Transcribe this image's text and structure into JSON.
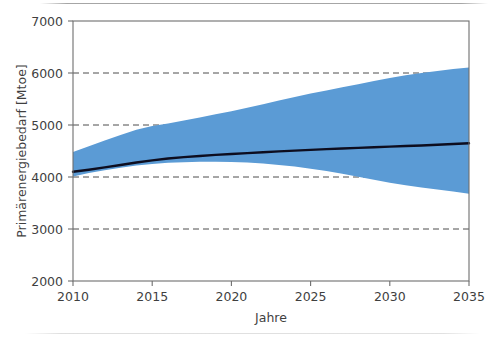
{
  "chart_data": {
    "type": "area",
    "title": "",
    "subtitle": "",
    "xlabel": "Jahre",
    "ylabel": "Primärenergiebedarf [Mtoe]",
    "xlim": [
      2010,
      2035
    ],
    "ylim": [
      2000,
      7000
    ],
    "x_ticks": [
      2010,
      2015,
      2020,
      2025,
      2030,
      2035
    ],
    "x_tick_labels": [
      "2010",
      "2015",
      "2020",
      "2025",
      "2030",
      "2035"
    ],
    "y_ticks": [
      2000,
      3000,
      4000,
      5000,
      6000,
      7000
    ],
    "y_tick_labels": [
      "2000",
      "3000",
      "4000",
      "5000",
      "6000",
      "7000"
    ],
    "grid": "horizontal-dashed",
    "gridlines_at": [
      3000,
      4000,
      5000,
      6000
    ],
    "legend": "none",
    "legend_position": "none",
    "colors": {
      "band": "#5B9BD5",
      "line": "#0d0d1f",
      "grid": "#4d4d4d",
      "frame": "#6e6e6e",
      "text": "#3f3f3f",
      "background": "#ffffff"
    },
    "x": [
      2010,
      2011,
      2012,
      2013,
      2014,
      2015,
      2016,
      2017,
      2018,
      2019,
      2020,
      2021,
      2022,
      2023,
      2024,
      2025,
      2026,
      2027,
      2028,
      2029,
      2030,
      2031,
      2032,
      2033,
      2034,
      2035
    ],
    "series": [
      {
        "name": "Zentrale Projektion",
        "type": "line",
        "values": [
          4100,
          4140,
          4185,
          4232,
          4278,
          4320,
          4355,
          4383,
          4405,
          4425,
          4443,
          4460,
          4477,
          4493,
          4508,
          4522,
          4536,
          4549,
          4561,
          4573,
          4585,
          4596,
          4607,
          4620,
          4634,
          4650
        ]
      },
      {
        "name": "Bandbreite Obergrenze",
        "type": "band-upper",
        "values": [
          4480,
          4590,
          4700,
          4810,
          4910,
          4980,
          5030,
          5085,
          5145,
          5205,
          5265,
          5330,
          5400,
          5470,
          5540,
          5605,
          5665,
          5725,
          5785,
          5845,
          5905,
          5955,
          6000,
          6040,
          6075,
          6105
        ]
      },
      {
        "name": "Bandbreite Untergrenze",
        "type": "band-lower",
        "values": [
          4010,
          4075,
          4130,
          4180,
          4220,
          4250,
          4272,
          4285,
          4292,
          4295,
          4290,
          4278,
          4258,
          4232,
          4200,
          4160,
          4115,
          4063,
          4005,
          3945,
          3888,
          3840,
          3800,
          3762,
          3720,
          3680
        ]
      }
    ]
  }
}
